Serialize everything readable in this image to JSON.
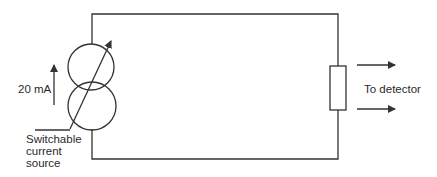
{
  "diagram": {
    "type": "circuit",
    "current_label": "20 mA",
    "source_label": {
      "line1": "Switchable",
      "line2": "current",
      "line3": "source"
    },
    "output_label": "To detector",
    "colors": {
      "line": "#333333",
      "text": "#2a2a2a",
      "background": "#ffffff"
    },
    "components": [
      {
        "name": "switchable-current-source",
        "symbol": "two overlapping circles with variable arrow"
      },
      {
        "name": "resistor",
        "symbol": "rectangle"
      }
    ]
  }
}
